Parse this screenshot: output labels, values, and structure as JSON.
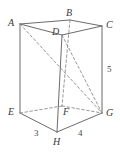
{
  "figure": {
    "stroke_color": "#6b6b6b",
    "hidden_stroke_color": "#8d8d8d",
    "background_color": "#ffffff",
    "label_color": "#3a3a3a",
    "vertices": [
      {
        "id": "A",
        "label": "A",
        "x": 20,
        "y": 24,
        "label_x": 8,
        "label_y": 18,
        "hidden": false
      },
      {
        "id": "B",
        "label": "B",
        "x": 70,
        "y": 20,
        "label_x": 66,
        "label_y": 8,
        "hidden": false
      },
      {
        "id": "C",
        "label": "C",
        "x": 102,
        "y": 26,
        "label_x": 106,
        "label_y": 20,
        "hidden": false
      },
      {
        "id": "D",
        "label": "D",
        "x": 62,
        "y": 35,
        "label_x": 52,
        "label_y": 27,
        "hidden": false
      },
      {
        "id": "E",
        "label": "E",
        "x": 20,
        "y": 113,
        "label_x": 8,
        "label_y": 107,
        "hidden": false
      },
      {
        "id": "F",
        "label": "F",
        "x": 62,
        "y": 106,
        "label_x": 63,
        "label_y": 107,
        "hidden": true
      },
      {
        "id": "G",
        "label": "G",
        "x": 102,
        "y": 113,
        "label_x": 106,
        "label_y": 108,
        "hidden": false
      },
      {
        "id": "H",
        "label": "H",
        "x": 57,
        "y": 132,
        "label_x": 53,
        "label_y": 137,
        "hidden": false
      }
    ],
    "solid_edges": [
      {
        "name": "edge-A-B",
        "from": "A",
        "to": "B"
      },
      {
        "name": "edge-B-C",
        "from": "B",
        "to": "C"
      },
      {
        "name": "edge-A-D",
        "from": "A",
        "to": "D"
      },
      {
        "name": "edge-D-C",
        "from": "D",
        "to": "C"
      },
      {
        "name": "edge-A-E",
        "from": "A",
        "to": "E"
      },
      {
        "name": "edge-C-G",
        "from": "C",
        "to": "G"
      },
      {
        "name": "edge-D-H",
        "from": "D",
        "to": "H"
      },
      {
        "name": "edge-E-H",
        "from": "E",
        "to": "H"
      },
      {
        "name": "edge-H-G",
        "from": "H",
        "to": "G"
      }
    ],
    "hidden_edges": [
      {
        "name": "edge-B-F",
        "from": "B",
        "to": "F"
      },
      {
        "name": "edge-E-F",
        "from": "E",
        "to": "F"
      },
      {
        "name": "edge-F-G",
        "from": "F",
        "to": "G"
      }
    ],
    "diagonals": [
      {
        "name": "diagonal-A-G",
        "from": "A",
        "to": "G"
      },
      {
        "name": "diagonal-D-G",
        "from": "D",
        "to": "G"
      }
    ],
    "measurements": [
      {
        "name": "measure-depth",
        "value": "3",
        "x": 34,
        "y": 128,
        "edge": "E-H"
      },
      {
        "name": "measure-width",
        "value": "4",
        "x": 78,
        "y": 128,
        "edge": "H-G"
      },
      {
        "name": "measure-height",
        "value": "5",
        "x": 107,
        "y": 64,
        "edge": "C-G"
      }
    ]
  }
}
